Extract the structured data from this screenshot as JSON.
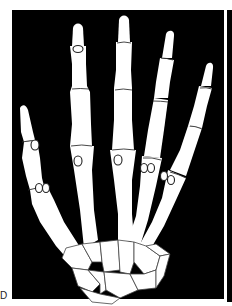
{
  "figure": {
    "panel_label": "D",
    "colors": {
      "background": "#000000",
      "bone": "#ffffff",
      "outline": "#333333",
      "page": "#ffffff"
    },
    "parts": {
      "digits": [
        "thumb",
        "index",
        "middle",
        "ring",
        "little"
      ],
      "sesamoids": "marked with circles at MCP and IP joints",
      "carpus": "carpal bones at base"
    }
  }
}
